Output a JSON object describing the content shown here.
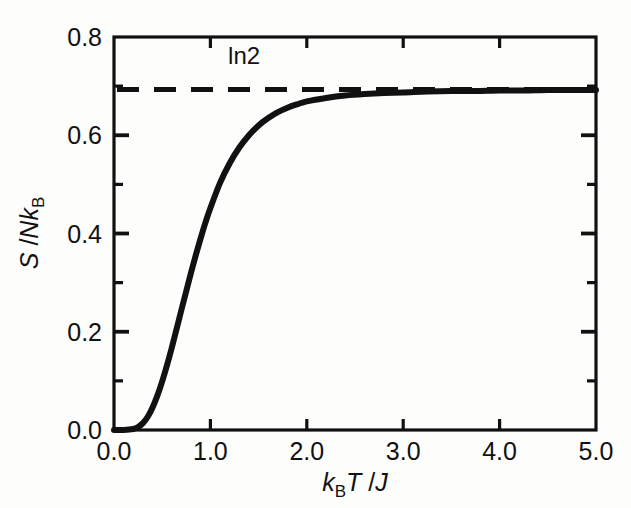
{
  "figure": {
    "background_color": "#fdfdfc",
    "line_color": "#111111",
    "axis_color": "#111111"
  },
  "axes": {
    "x_label_parts": {
      "k": "k",
      "B": "B",
      "T": "T",
      "slash": " /",
      "J": "J"
    },
    "x_label_text": "kBT /J",
    "y_label_parts": {
      "S": "S",
      "slash": " /",
      "N": "N",
      "k": "k",
      "B": "B"
    },
    "y_label_text": "S /NkB",
    "x_tick_labels": [
      "0.0",
      "1.0",
      "2.0",
      "3.0",
      "4.0",
      "5.0"
    ],
    "y_tick_labels": [
      "0.0",
      "0.2",
      "0.4",
      "0.6",
      "0.8"
    ]
  },
  "annotations": [
    {
      "name": "ln2-label",
      "text": "ln2",
      "x": 1.35,
      "y": 0.745
    }
  ],
  "chart_data": {
    "type": "line",
    "title": "",
    "xlabel": "kBT /J",
    "ylabel": "S /NkB",
    "xlim": [
      0.0,
      5.0
    ],
    "ylim": [
      0.0,
      0.8
    ],
    "grid": false,
    "legend": "none",
    "xticks": [
      0.0,
      1.0,
      2.0,
      3.0,
      4.0,
      5.0
    ],
    "yticks": [
      0.0,
      0.2,
      0.4,
      0.6,
      0.8
    ],
    "xminorticks": [],
    "yminorticks": [
      0.1,
      0.3,
      0.5,
      0.7
    ],
    "series": [
      {
        "name": "entropy",
        "style": "solid",
        "linewidth": 6,
        "x": [
          0.0,
          0.1,
          0.2,
          0.25,
          0.3,
          0.35,
          0.4,
          0.45,
          0.5,
          0.55,
          0.6,
          0.65,
          0.7,
          0.75,
          0.8,
          0.85,
          0.9,
          0.95,
          1.0,
          1.1,
          1.2,
          1.3,
          1.4,
          1.5,
          1.6,
          1.7,
          1.8,
          1.9,
          2.0,
          2.2,
          2.4,
          2.6,
          2.8,
          3.0,
          3.25,
          3.5,
          3.75,
          4.0,
          4.25,
          4.5,
          4.75,
          5.0
        ],
        "y": [
          0.0,
          0.0,
          0.002,
          0.006,
          0.014,
          0.027,
          0.046,
          0.07,
          0.099,
          0.132,
          0.168,
          0.206,
          0.245,
          0.283,
          0.321,
          0.357,
          0.391,
          0.423,
          0.452,
          0.503,
          0.543,
          0.575,
          0.6,
          0.62,
          0.635,
          0.647,
          0.656,
          0.663,
          0.669,
          0.676,
          0.681,
          0.684,
          0.686,
          0.687,
          0.689,
          0.69,
          0.69,
          0.691,
          0.691,
          0.692,
          0.692,
          0.692
        ]
      },
      {
        "name": "ln2-asymptote",
        "style": "dashed",
        "linewidth": 5,
        "value": 0.693,
        "label": "ln2"
      }
    ]
  }
}
